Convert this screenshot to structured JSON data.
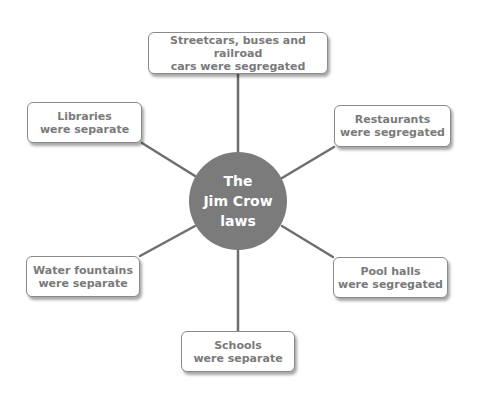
{
  "diagram": {
    "type": "spider-map",
    "colors": {
      "hub_fill": "#7b7b7b",
      "hub_text": "#ffffff",
      "box_border": "#8a8a8a",
      "box_text": "#7a7a7a",
      "connector": "#6e6e6e"
    },
    "hub": {
      "line1": "The",
      "line2": "Jim Crow",
      "line3": "laws"
    },
    "nodes": [
      {
        "id": "streetcars",
        "line1": "Streetcars, buses and railroad",
        "line2": "cars were segregated"
      },
      {
        "id": "libraries",
        "line1": "Libraries",
        "line2": "were separate"
      },
      {
        "id": "restaurants",
        "line1": "Restaurants",
        "line2": "were segregated"
      },
      {
        "id": "water-fountains",
        "line1": "Water fountains",
        "line2": "were separate"
      },
      {
        "id": "pool-halls",
        "line1": "Pool halls",
        "line2": "were segregated"
      },
      {
        "id": "schools",
        "line1": "Schools",
        "line2": "were separate"
      }
    ]
  }
}
